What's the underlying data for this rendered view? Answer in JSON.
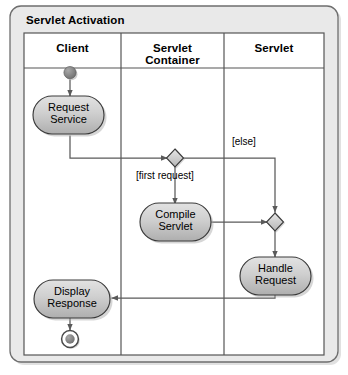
{
  "diagram": {
    "kind": "uml-activity-diagram",
    "frame_title": "Servlet Activation",
    "background_color": "#ffffff",
    "frame_fill": "#e9e9e9",
    "frame_border": "#6e6e6e",
    "lane_fill": "#ffffff",
    "lane_border": "#555555",
    "node_fill_top": "#dcdcdc",
    "node_fill_bottom": "#b4b4b4",
    "node_border": "#3a3a3a",
    "edge_color": "#5a5a5a",
    "shadow_color": "#9a9a9a"
  },
  "lanes": [
    {
      "id": "client",
      "label": "Client"
    },
    {
      "id": "servlet-container",
      "label": "Servlet\nContainer",
      "line1": "Servlet",
      "line2": "Container"
    },
    {
      "id": "servlet",
      "label": "Servlet"
    }
  ],
  "nodes": [
    {
      "id": "start",
      "type": "initial-node",
      "lane": "client",
      "label": ""
    },
    {
      "id": "request-service",
      "type": "action",
      "lane": "client",
      "line1": "Request",
      "line2": "Service"
    },
    {
      "id": "decision-first-request",
      "type": "decision",
      "lane": "servlet-container",
      "label": ""
    },
    {
      "id": "compile-servlet",
      "type": "action",
      "lane": "servlet-container",
      "line1": "Compile",
      "line2": "Servlet"
    },
    {
      "id": "merge-handle",
      "type": "merge",
      "lane": "servlet",
      "label": ""
    },
    {
      "id": "handle-request",
      "type": "action",
      "lane": "servlet",
      "line1": "Handle",
      "line2": "Request"
    },
    {
      "id": "display-response",
      "type": "action",
      "lane": "client",
      "line1": "Display",
      "line2": "Response"
    },
    {
      "id": "final",
      "type": "final-node",
      "lane": "client",
      "label": ""
    }
  ],
  "guards": [
    {
      "id": "guard-first-request",
      "text": "[first request]",
      "from": "decision-first-request",
      "to": "compile-servlet"
    },
    {
      "id": "guard-else",
      "text": "[else]",
      "from": "decision-first-request",
      "to": "merge-handle"
    }
  ],
  "edges": [
    {
      "id": "edge-start-to-request",
      "from": "start",
      "to": "request-service"
    },
    {
      "id": "edge-request-to-decision",
      "from": "request-service",
      "to": "decision-first-request"
    },
    {
      "id": "edge-decision-to-compile",
      "from": "decision-first-request",
      "to": "compile-servlet",
      "guard": "[first request]"
    },
    {
      "id": "edge-decision-to-merge",
      "from": "decision-first-request",
      "to": "merge-handle",
      "guard": "[else]"
    },
    {
      "id": "edge-compile-to-merge",
      "from": "compile-servlet",
      "to": "merge-handle"
    },
    {
      "id": "edge-merge-to-handle",
      "from": "merge-handle",
      "to": "handle-request"
    },
    {
      "id": "edge-handle-to-display",
      "from": "handle-request",
      "to": "display-response"
    },
    {
      "id": "edge-display-to-final",
      "from": "display-response",
      "to": "final"
    }
  ]
}
